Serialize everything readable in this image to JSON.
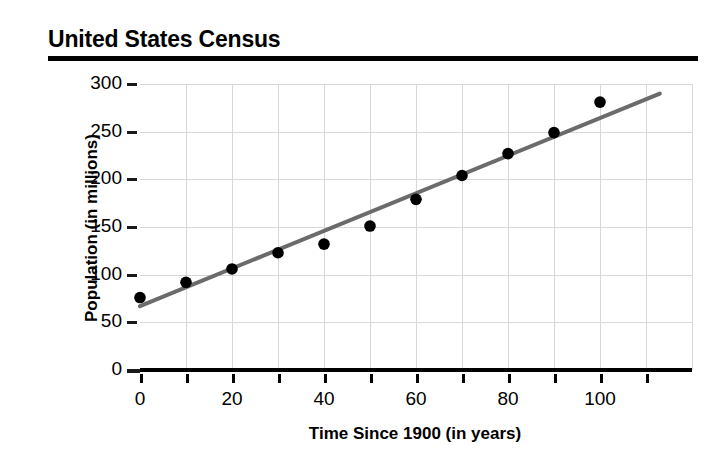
{
  "title": "United States Census",
  "chart_data": {
    "type": "scatter",
    "title": "United States Census",
    "xlabel": "Time Since 1900 (in years)",
    "ylabel": "Population (in millions)",
    "xlim": [
      0,
      120
    ],
    "ylim": [
      0,
      300
    ],
    "grid": true,
    "legend": null,
    "x_major_ticks": [
      0,
      20,
      40,
      60,
      80,
      100
    ],
    "x_minor_ticks": [
      10,
      30,
      50,
      70,
      90,
      110
    ],
    "x_tick_labels": [
      "0",
      "20",
      "40",
      "60",
      "80",
      "100"
    ],
    "y_ticks": [
      0,
      50,
      100,
      150,
      200,
      250,
      300
    ],
    "y_tick_labels": [
      "0",
      "50",
      "100",
      "150",
      "200",
      "250",
      "300"
    ],
    "marker_color": "#000000",
    "trendline_color": "#6b6b6b",
    "gridline_color": "#d8d8d8",
    "x": [
      0,
      10,
      20,
      30,
      40,
      50,
      60,
      70,
      80,
      90,
      100
    ],
    "values": [
      76,
      92,
      106,
      123,
      132,
      151,
      179,
      204,
      227,
      249,
      281
    ],
    "points": [
      {
        "x": 0,
        "y": 76
      },
      {
        "x": 10,
        "y": 92
      },
      {
        "x": 20,
        "y": 106
      },
      {
        "x": 30,
        "y": 123
      },
      {
        "x": 40,
        "y": 132
      },
      {
        "x": 50,
        "y": 151
      },
      {
        "x": 60,
        "y": 179
      },
      {
        "x": 70,
        "y": 204
      },
      {
        "x": 80,
        "y": 227
      },
      {
        "x": 90,
        "y": 249
      },
      {
        "x": 100,
        "y": 281
      }
    ],
    "trendline": {
      "x_start": 0,
      "y_start": 67,
      "x_end": 113,
      "y_end": 290
    }
  }
}
